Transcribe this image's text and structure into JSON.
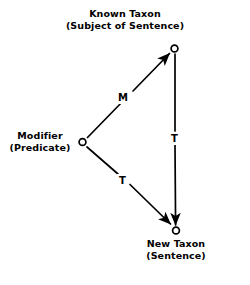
{
  "diagram": {
    "title_present": false,
    "background_color": "#ffffff",
    "ink_color": "#000000",
    "nodes": [
      {
        "id": "known-taxon",
        "line1": "Known Taxon",
        "line2": "(Subject of Sentence)",
        "x": 174,
        "y": 48,
        "marker": "open-circle"
      },
      {
        "id": "modifier",
        "line1": "Modifier",
        "line2": "(Predicate)",
        "x": 82,
        "y": 142,
        "marker": "open-circle"
      },
      {
        "id": "new-taxon",
        "line1": "New Taxon",
        "line2": "(Sentence)",
        "x": 176,
        "y": 230,
        "marker": "open-circle"
      }
    ],
    "edges": [
      {
        "id": "modifier-to-known-taxon",
        "label": "M",
        "from": "modifier",
        "to": "known-taxon",
        "arrowhead": "at-target"
      },
      {
        "id": "known-taxon-to-new-taxon",
        "label": "T",
        "from": "known-taxon",
        "to": "new-taxon",
        "arrowhead": "at-target"
      },
      {
        "id": "modifier-to-new-taxon",
        "label": "T",
        "from": "modifier",
        "to": "new-taxon",
        "arrowhead": "at-target"
      }
    ]
  }
}
